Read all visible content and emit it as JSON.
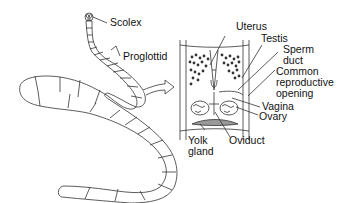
{
  "diagram": {
    "labels": {
      "scolex": "Scolex",
      "proglottid": "Proglottid",
      "uterus": "Uterus",
      "testis": "Testis",
      "sperm_duct_1": "Sperm",
      "sperm_duct_2": "duct",
      "common_1": "Common",
      "common_2": "reproductive",
      "common_3": "opening",
      "vagina": "Vagina",
      "ovary": "Ovary",
      "yolk_1": "Yolk",
      "yolk_2": "gland",
      "oviduct": "Oviduct"
    }
  }
}
